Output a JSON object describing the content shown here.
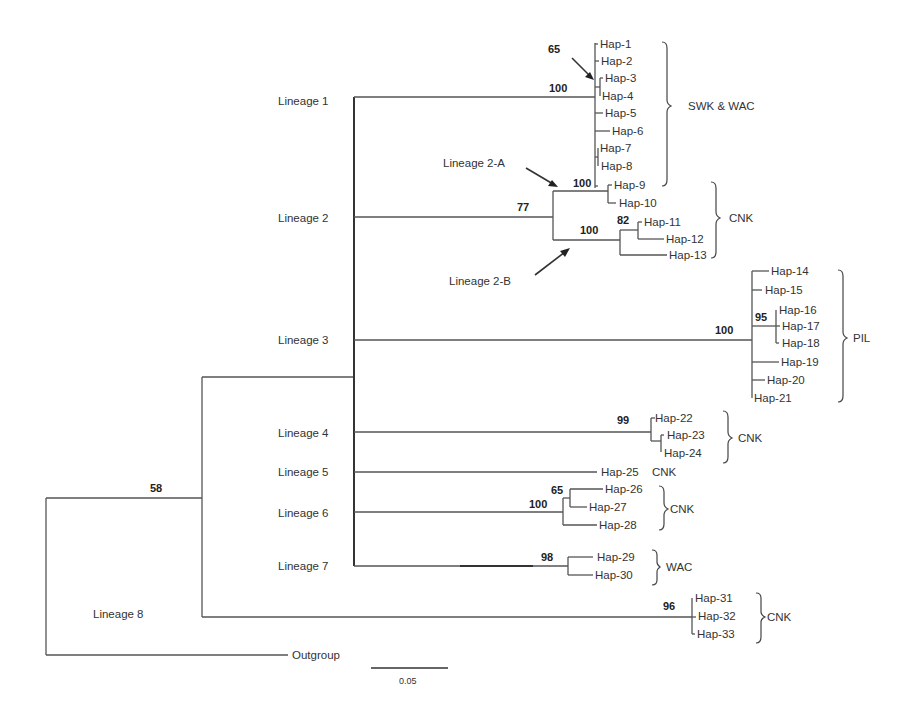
{
  "figure": {
    "type": "phylogenetic-tree",
    "scale_bar_label": "0.05",
    "outgroup_label": "Outgroup"
  },
  "lineages": [
    {
      "id": "L1",
      "label": "Lineage 1",
      "bootstrap": "100",
      "group": "SWK & WAC"
    },
    {
      "id": "L2",
      "label": "Lineage 2",
      "bootstrap": "77",
      "group": "CNK"
    },
    {
      "id": "L3",
      "label": "Lineage 3",
      "bootstrap": "100",
      "group": "PIL"
    },
    {
      "id": "L4",
      "label": "Lineage 4",
      "bootstrap": "99",
      "group": "CNK"
    },
    {
      "id": "L5",
      "label": "Lineage 5",
      "bootstrap": "",
      "group": "CNK"
    },
    {
      "id": "L6",
      "label": "Lineage 6",
      "bootstrap": "100",
      "group": "CNK"
    },
    {
      "id": "L7",
      "label": "Lineage 7",
      "bootstrap": "98",
      "group": "WAC"
    },
    {
      "id": "L8",
      "label": "Lineage 8",
      "bootstrap": "96",
      "group": "CNK"
    }
  ],
  "sublineages": {
    "L2A": {
      "label": "Lineage 2-A",
      "bootstrap": "100"
    },
    "L2B": {
      "label": "Lineage 2-B",
      "bootstrap": "100"
    }
  },
  "inner_bootstraps": {
    "L1_hap3_4": "65",
    "L2B_hap11_12": "82",
    "L3_hap16_18": "95",
    "L6_hap26_27": "65",
    "root_ingroup": "58"
  },
  "haplotypes": [
    "Hap-1",
    "Hap-2",
    "Hap-3",
    "Hap-4",
    "Hap-5",
    "Hap-6",
    "Hap-7",
    "Hap-8",
    "Hap-9",
    "Hap-10",
    "Hap-11",
    "Hap-12",
    "Hap-13",
    "Hap-14",
    "Hap-15",
    "Hap-16",
    "Hap-17",
    "Hap-18",
    "Hap-19",
    "Hap-20",
    "Hap-21",
    "Hap-22",
    "Hap-23",
    "Hap-24",
    "Hap-25",
    "Hap-26",
    "Hap-27",
    "Hap-28",
    "Hap-29",
    "Hap-30",
    "Hap-31",
    "Hap-32",
    "Hap-33"
  ],
  "groups": {
    "g1": "SWK & WAC",
    "g2": "CNK",
    "g3": "PIL",
    "g4": "CNK",
    "g5": "CNK",
    "g6": "CNK",
    "g7": "WAC",
    "g8": "CNK"
  }
}
